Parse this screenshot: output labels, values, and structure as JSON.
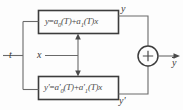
{
  "diagram": {
    "type": "block-diagram",
    "inputs": {
      "t_label": "t",
      "x_label": "x"
    },
    "blocks": [
      {
        "name": "upper-equation-block",
        "equation_parts": {
          "lhs": "y",
          "eq": "=",
          "term1_coef": "a",
          "term1_sub": "0",
          "term1_arg": "(T)",
          "plus": "+",
          "term2_coef": "a",
          "term2_sub": "1",
          "term2_arg": "(T)",
          "term2_var": "x"
        },
        "output_label": "y"
      },
      {
        "name": "lower-equation-block",
        "equation_parts": {
          "lhs": "y'",
          "eq": "=",
          "term1_coef": "a'",
          "term1_sub": "0",
          "term1_arg": "(T)",
          "plus": "+",
          "term2_coef": "a'",
          "term2_sub": "1",
          "term2_arg": "(T)",
          "term2_var": "x"
        },
        "output_label": "y'"
      }
    ],
    "summing_junction": {
      "name": "summing-junction",
      "sign": "+"
    },
    "output": {
      "label": "y",
      "overbar": true
    },
    "colors": {
      "line": "#555555",
      "box_border": "#3c3c3c",
      "text": "#4a4a4a",
      "background": "#fdfdfd"
    }
  }
}
